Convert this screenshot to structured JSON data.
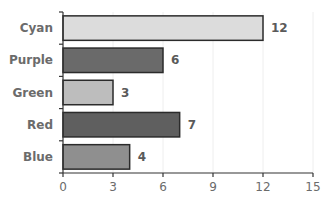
{
  "chart_data": {
    "type": "bar",
    "orientation": "horizontal",
    "title": "",
    "xlabel": "",
    "ylabel": "",
    "categories": [
      "Cyan",
      "Purple",
      "Green",
      "Red",
      "Blue"
    ],
    "values": [
      12,
      6,
      3,
      7,
      4
    ],
    "bar_colors": [
      "#dcdcdc",
      "#6a6a6a",
      "#bdbdbd",
      "#5f5f5f",
      "#8f8f8f"
    ],
    "bar_border_color": "#2b2b2b",
    "value_labels": [
      "12",
      "6",
      "3",
      "7",
      "4"
    ],
    "xlim": [
      0,
      15
    ],
    "xticks": [
      0,
      3,
      6,
      9,
      12,
      15
    ],
    "xtick_labels": [
      "0",
      "3",
      "6",
      "9",
      "12",
      "15"
    ],
    "grid": {
      "vertical": true,
      "horizontal": false,
      "color": "#eeeeee"
    },
    "legend": null
  }
}
